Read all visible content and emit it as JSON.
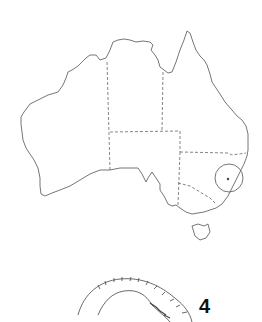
{
  "figure": {
    "type": "distribution-map",
    "region": "Australia",
    "marker": {
      "shape": "circle",
      "location": "eastern New South Wales coast"
    },
    "specimen_label": "4"
  },
  "colors": {
    "outline": "#555555",
    "background": "#ffffff",
    "label": "#111111"
  }
}
